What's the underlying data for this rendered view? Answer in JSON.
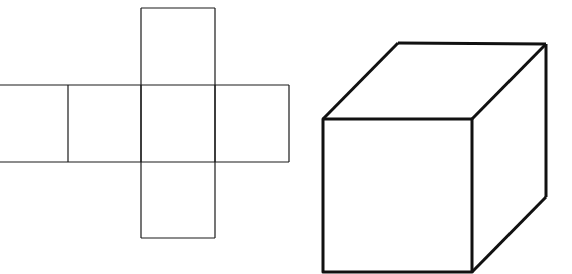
{
  "diagram": {
    "background": "#ffffff",
    "stroke_color": "#1a1a1a",
    "net": {
      "description": "Cube net (cross shape): vertical column of 4 squares intersecting horizontal row of 4 squares",
      "stroke_width": 1.2,
      "column": {
        "x1": 141,
        "x2": 215,
        "ys": [
          8,
          85,
          162,
          238
        ]
      },
      "row": {
        "y1": 85,
        "y2": 162,
        "xs": [
          0,
          68,
          141,
          215,
          289
        ]
      }
    },
    "cube": {
      "description": "3D isometric-style cube drawing",
      "stroke_width": 3,
      "front_face": {
        "x1": 323,
        "y1": 119,
        "x2": 472,
        "y2": 272
      },
      "back_top_left": [
        398,
        43
      ],
      "back_top_right": [
        546,
        44
      ],
      "back_bottom_right": [
        546,
        197
      ]
    }
  }
}
